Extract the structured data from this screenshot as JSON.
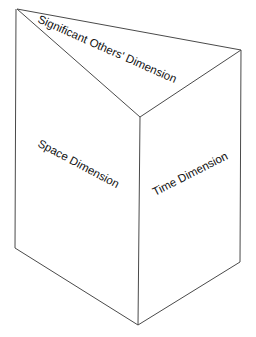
{
  "diagram": {
    "labels": {
      "top_face": "Significant Others' Dimension",
      "left_face": "Space Dimension",
      "right_face": "Time Dimension"
    },
    "colors": {
      "edge": "#4a4a4a",
      "text": "#111111",
      "background": "#ffffff"
    },
    "vertices": {
      "top_left": [
        17,
        9
      ],
      "top_right": [
        241,
        50
      ],
      "top_front": [
        140,
        117
      ],
      "bottom_left": [
        15,
        248
      ],
      "bottom_right": [
        240,
        262
      ],
      "bottom_front": [
        138,
        325
      ]
    }
  }
}
